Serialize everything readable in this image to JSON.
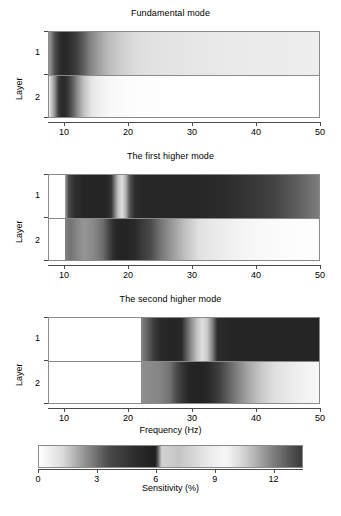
{
  "figure": {
    "axis_label_x": "Frequency (Hz)",
    "axis_label_y": "Layer",
    "colorbar_label": "Sensitivity (%)"
  },
  "chart_data": {
    "type": "heatmap",
    "title": "",
    "xlabel": "Frequency (Hz)",
    "ylabel": "Layer",
    "colorbar_label": "Sensitivity (%)",
    "xlim": [
      7.5,
      50
    ],
    "xticks": [
      10,
      20,
      30,
      40,
      50
    ],
    "xticklabels": [
      "10",
      "20",
      "30",
      "40",
      "50"
    ],
    "yticks": [
      1,
      2
    ],
    "yticklabels": [
      "1",
      "2"
    ],
    "grid": false,
    "legend": "colorbar-below",
    "colormap": {
      "name": "cyclic-grayscale",
      "vmin": 0,
      "vmax": 13.5,
      "ticks": [
        0,
        3,
        6,
        9,
        12
      ],
      "ticklabels": [
        "0",
        "3",
        "6",
        "9",
        "12"
      ],
      "stops": [
        {
          "value": 0.0,
          "hex": "#ffffff"
        },
        {
          "value": 1.2,
          "hex": "#dcdcdc"
        },
        {
          "value": 2.4,
          "hex": "#8f8f8f"
        },
        {
          "value": 3.6,
          "hex": "#4a4a4a"
        },
        {
          "value": 5.0,
          "hex": "#2b2b2b"
        },
        {
          "value": 6.0,
          "hex": "#1f1f1f"
        },
        {
          "value": 6.3,
          "hex": "#d2d2d2"
        },
        {
          "value": 7.2,
          "hex": "#c4c4c4"
        },
        {
          "value": 8.6,
          "hex": "#e8e8e8"
        },
        {
          "value": 9.6,
          "hex": "#f7f7f7"
        },
        {
          "value": 10.6,
          "hex": "#cfcfcf"
        },
        {
          "value": 11.8,
          "hex": "#8a8a8a"
        },
        {
          "value": 13.0,
          "hex": "#4f4f4f"
        },
        {
          "value": 13.5,
          "hex": "#3a3a3a"
        }
      ]
    },
    "panels": [
      {
        "title": "Fundamental mode",
        "rows": [
          {
            "layer": "1",
            "x": [
              7.5,
              8.5,
              9.2,
              9.8,
              10.4,
              11.2,
              12.0,
              13.0,
              14.0,
              15.5,
              17.0,
              19.0,
              21.0,
              24.0,
              28.0,
              33.0,
              39.0,
              45.0,
              50.0
            ],
            "sensitivity": [
              2.2,
              3.6,
              4.8,
              5.3,
              5.2,
              4.6,
              3.9,
              3.2,
              2.6,
              2.1,
              1.7,
              1.4,
              1.2,
              1.0,
              0.9,
              0.8,
              0.7,
              0.65,
              0.6
            ]
          },
          {
            "layer": "2",
            "x": [
              7.5,
              8.4,
              9.0,
              9.5,
              10.0,
              10.6,
              11.3,
              12.0,
              13.0,
              14.2,
              15.5,
              17.0,
              20.0,
              25.0,
              30.0,
              40.0,
              50.0
            ],
            "sensitivity": [
              0.6,
              2.4,
              4.2,
              5.1,
              5.0,
              4.2,
              3.2,
              2.4,
              1.6,
              0.9,
              0.5,
              0.25,
              0.1,
              0.05,
              0.0,
              0.0,
              0.0
            ]
          }
        ]
      },
      {
        "title": "The first higher mode",
        "xstart": 10.0,
        "rows": [
          {
            "layer": "1",
            "x": [
              10.0,
              10.6,
              11.5,
              13.0,
              15.0,
              16.5,
              17.3,
              17.9,
              18.4,
              19.0,
              19.6,
              20.2,
              21.0,
              22.5,
              25.0,
              28.0,
              31.0,
              35.0,
              39.0,
              43.0,
              47.0,
              50.0
            ],
            "sensitivity": [
              2.0,
              3.6,
              4.8,
              5.4,
              5.5,
              5.4,
              4.6,
              2.6,
              1.6,
              1.1,
              1.9,
              3.4,
              4.9,
              5.3,
              5.4,
              5.4,
              5.3,
              5.0,
              4.5,
              3.9,
              3.2,
              2.7
            ]
          },
          {
            "layer": "2",
            "x": [
              10.0,
              10.8,
              11.8,
              13.0,
              14.5,
              16.0,
              17.0,
              17.6,
              18.2,
              19.0,
              20.0,
              21.0,
              22.0,
              23.5,
              25.0,
              27.0,
              29.0,
              31.0,
              33.0,
              36.0,
              40.0,
              45.0,
              50.0
            ],
            "sensitivity": [
              2.6,
              2.9,
              2.6,
              2.3,
              2.5,
              3.0,
              3.9,
              4.8,
              5.4,
              5.6,
              5.5,
              5.1,
              4.4,
              3.6,
              2.9,
              2.2,
              1.6,
              1.1,
              0.8,
              0.5,
              0.25,
              0.1,
              0.05
            ]
          }
        ]
      },
      {
        "title": "The second higher mode",
        "xstart": 22.0,
        "rows": [
          {
            "layer": "1",
            "x": [
              22.0,
              23.0,
              24.0,
              25.0,
              26.2,
              27.4,
              28.4,
              29.2,
              30.0,
              30.8,
              31.6,
              32.4,
              33.2,
              34.0,
              36.0,
              40.0,
              45.0,
              50.0
            ],
            "sensitivity": [
              2.6,
              3.2,
              4.3,
              5.1,
              5.4,
              5.5,
              5.0,
              3.2,
              2.3,
              1.6,
              1.1,
              1.5,
              2.6,
              5.0,
              5.4,
              5.5,
              5.5,
              5.5
            ]
          },
          {
            "layer": "2",
            "x": [
              22.0,
              23.5,
              25.0,
              26.5,
              27.6,
              28.6,
              29.6,
              30.6,
              31.6,
              32.6,
              33.6,
              34.6,
              36.0,
              37.5,
              39.0,
              41.0,
              43.0,
              45.0,
              47.0,
              50.0
            ],
            "sensitivity": [
              2.4,
              2.5,
              2.6,
              2.9,
              3.6,
              4.6,
              5.4,
              5.7,
              5.6,
              5.2,
              4.5,
              3.8,
              3.1,
              2.5,
              2.0,
              1.5,
              1.1,
              0.8,
              0.5,
              0.25
            ]
          }
        ]
      }
    ]
  }
}
